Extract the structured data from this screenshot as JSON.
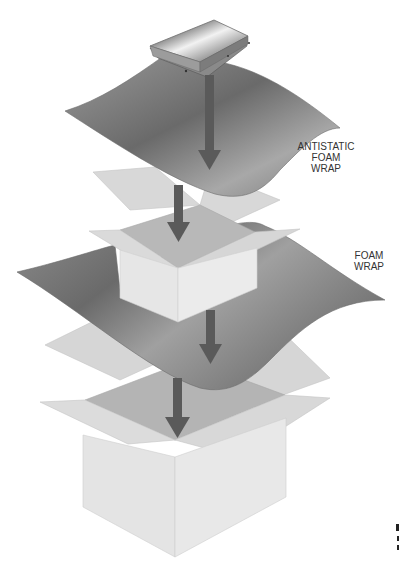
{
  "diagram": {
    "components": [
      {
        "id": "hard-drive",
        "name": "Hard disk drive"
      },
      {
        "id": "antistatic-foam-wrap",
        "name": "Antistatic foam wrap"
      },
      {
        "id": "inner-box",
        "name": "Inner box"
      },
      {
        "id": "foam-wrap",
        "name": "Foam wrap"
      },
      {
        "id": "outer-box",
        "name": "Outer box"
      }
    ],
    "labels": {
      "antistatic": [
        "ANTISTATIC",
        "FOAM",
        "WRAP"
      ],
      "foam": [
        "FOAM",
        "WRAP"
      ]
    },
    "arrows": 4,
    "colors": {
      "arrow": "#5a5a5a",
      "box_light": "#e6e6e6",
      "box_flap": "#d2d2d2",
      "box_inside": "#b8b8b8",
      "foam_dark": "#6e6e6e",
      "foam_light": "#b5b5b5",
      "text": "#333333"
    }
  }
}
